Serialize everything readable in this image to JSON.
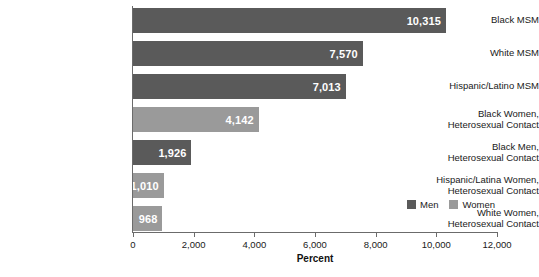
{
  "chart_data": {
    "type": "bar",
    "orientation": "horizontal",
    "title": "",
    "xlabel": "Percent",
    "ylabel": "",
    "xlim": [
      0,
      12000
    ],
    "xticks": [
      0,
      2000,
      4000,
      6000,
      8000,
      10000,
      12000
    ],
    "xticklabels": [
      "0",
      "2,000",
      "4,000",
      "6,000",
      "8,000",
      "10,000",
      "12,000"
    ],
    "grid": false,
    "legend_position": "bottom-right",
    "categories": [
      "Black MSM",
      "White MSM",
      "Hispanic/Latino MSM",
      "Black Women, Heterosexual Contact",
      "Black Men, Heterosexual Contact",
      "Hispanic/Latina Women, Heterosexual Contact",
      "White Women, Heterosexual Contact"
    ],
    "category_lines": [
      [
        "Black MSM"
      ],
      [
        "White MSM"
      ],
      [
        "Hispanic/Latino MSM"
      ],
      [
        "Black Women,",
        "Heterosexual Contact"
      ],
      [
        "Black Men,",
        "Heterosexual Contact"
      ],
      [
        "Hispanic/Latina Women,",
        "Heterosexual Contact"
      ],
      [
        "White Women,",
        "Heterosexual Contact"
      ]
    ],
    "values": [
      10315,
      7570,
      7013,
      4142,
      1926,
      1010,
      968
    ],
    "value_labels": [
      "10,315",
      "7,570",
      "7,013",
      "4,142",
      "1,926",
      "1,010",
      "968"
    ],
    "series_of_bar": [
      "Men",
      "Men",
      "Men",
      "Women",
      "Men",
      "Women",
      "Women"
    ],
    "series": [
      {
        "name": "Men",
        "color": "#5a5a5a"
      },
      {
        "name": "Women",
        "color": "#9a9a9a"
      }
    ]
  },
  "legend": {
    "items": [
      {
        "label": "Men",
        "color": "#5a5a5a"
      },
      {
        "label": "Women",
        "color": "#9a9a9a"
      }
    ]
  },
  "axis": {
    "x_title": "Percent"
  }
}
